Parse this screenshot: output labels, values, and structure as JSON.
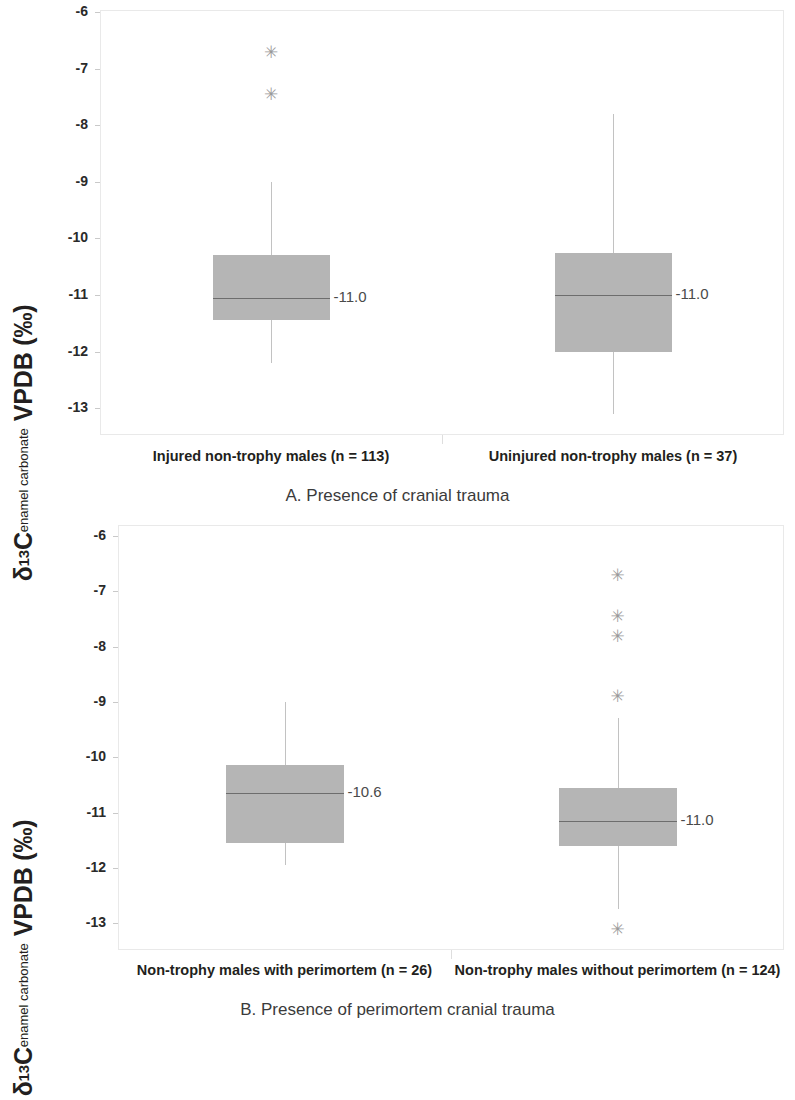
{
  "figure": {
    "y_axis_title_parts": {
      "delta": "δ",
      "superscript": "13",
      "element": "C",
      "subscript": "enamel carbonate",
      "scale": "VPDB (‰)"
    },
    "y_ticks": [
      "-6",
      "-7",
      "-8",
      "-9",
      "-10",
      "-11",
      "-12",
      "-13"
    ],
    "outlier_glyph": "✳"
  },
  "chart_data": [
    {
      "type": "box",
      "panel": "A",
      "title": "A. Presence of cranial trauma",
      "xlabel": "A. Presence of cranial trauma",
      "ylabel": "δ13C enamel carbonate VPDB (‰)",
      "ylim": [
        -13.5,
        -6
      ],
      "ytick_values": [
        -6,
        -7,
        -8,
        -9,
        -10,
        -11,
        -12,
        -13
      ],
      "grid": false,
      "legend": "none",
      "categories": [
        "Injured non-trophy males (n = 113)",
        "Uninjured non-trophy males (n = 37)"
      ],
      "boxes": [
        {
          "category": "Injured non-trophy males (n = 113)",
          "n": 113,
          "whisker_low": -12.2,
          "q1": -11.45,
          "median": -11.05,
          "median_label": "-11.0",
          "q3": -10.3,
          "whisker_high": -9.0,
          "outliers": [
            -6.7,
            -7.45
          ]
        },
        {
          "category": "Uninjured non-trophy males (n = 37)",
          "n": 37,
          "whisker_low": -13.1,
          "q1": -12.0,
          "median": -11.0,
          "median_label": "-11.0",
          "q3": -10.25,
          "whisker_high": -7.8,
          "outliers": []
        }
      ]
    },
    {
      "type": "box",
      "panel": "B",
      "title": "B. Presence of perimortem cranial trauma",
      "xlabel": "B. Presence of perimortem cranial trauma",
      "ylabel": "δ13C enamel carbonate VPDB (‰)",
      "ylim": [
        -13.5,
        -6
      ],
      "ytick_values": [
        -6,
        -7,
        -8,
        -9,
        -10,
        -11,
        -12,
        -13
      ],
      "grid": false,
      "legend": "none",
      "categories": [
        "Non-trophy males with perimortem (n = 26)",
        "Non-trophy males without perimortem (n = 124)"
      ],
      "boxes": [
        {
          "category": "Non-trophy males with perimortem (n = 26)",
          "n": 26,
          "whisker_low": -11.95,
          "q1": -11.55,
          "median": -10.65,
          "median_label": "-10.6",
          "q3": -10.15,
          "whisker_high": -9.0,
          "outliers": []
        },
        {
          "category": "Non-trophy males without perimortem (n = 124)",
          "n": 124,
          "whisker_low": -12.75,
          "q1": -11.6,
          "median": -11.15,
          "median_label": "-11.0",
          "q3": -10.55,
          "whisker_high": -9.3,
          "outliers": [
            -6.7,
            -7.45,
            -7.8,
            -8.9,
            -13.1
          ]
        }
      ]
    }
  ]
}
